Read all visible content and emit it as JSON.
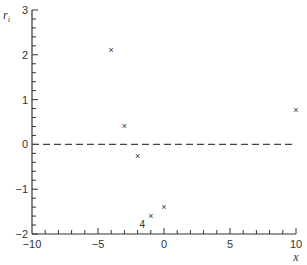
{
  "chart_data": {
    "type": "scatter",
    "title": "",
    "xlabel": "x",
    "ylabel": "r_i",
    "ylabel_main": "r",
    "ylabel_sub": "i",
    "xlim": [
      -10,
      10
    ],
    "ylim": [
      -2,
      3
    ],
    "xticks": [
      -10,
      -5,
      0,
      5,
      10
    ],
    "xtick_labels": [
      "−10",
      "−5",
      "0",
      "5",
      "10"
    ],
    "yticks": [
      -2,
      -1,
      0,
      1,
      2,
      3
    ],
    "ytick_labels": [
      "−2",
      "−1",
      "0",
      "1",
      "2",
      "3"
    ],
    "x_minor_step": 1,
    "y_minor_step": 0.2,
    "grid": false,
    "legend": null,
    "marker": "×",
    "reference_line": {
      "y": 0,
      "style": "dashed"
    },
    "series": [
      {
        "name": "residuals",
        "points": [
          {
            "x": -4,
            "y": 2.1
          },
          {
            "x": -3,
            "y": 0.4
          },
          {
            "x": -2,
            "y": -0.27
          },
          {
            "x": -1,
            "y": -1.6
          },
          {
            "x": 0,
            "y": -1.4
          },
          {
            "x": 10,
            "y": 0.76
          }
        ]
      }
    ],
    "annotations": [
      {
        "text": "4",
        "x": -1.5,
        "y": -1.78
      }
    ]
  },
  "colors": {
    "axis": "#333333",
    "points": "#333333",
    "dashed_line": "#444444",
    "background": "#ffffff"
  }
}
